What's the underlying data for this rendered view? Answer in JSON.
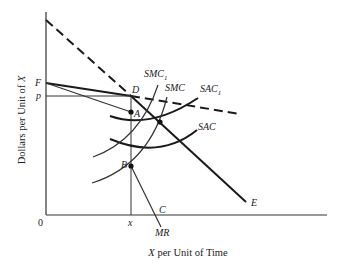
{
  "diagram": {
    "title": "",
    "axes": {
      "x_label_var": "X",
      "x_label_rest": " per Unit of Time",
      "y_label_pre": "Dollars per Unit of ",
      "y_label_var": "X",
      "origin_label": "0"
    },
    "tick_labels": {
      "p": "p",
      "F": "F",
      "x": "x"
    },
    "points": {
      "A": "A",
      "B": "B",
      "C": "C",
      "D": "D",
      "E": "E"
    },
    "curves": {
      "smc1": {
        "base": "SMC",
        "sub": "1"
      },
      "smc": {
        "base": "SMC",
        "sub": ""
      },
      "sac1": {
        "base": "SAC",
        "sub": "1"
      },
      "sac": {
        "base": "SAC",
        "sub": ""
      },
      "mr": "MR"
    },
    "colors": {
      "line": "#1a1a1a",
      "thin_line": "#333333",
      "background": "#ffffff"
    }
  }
}
